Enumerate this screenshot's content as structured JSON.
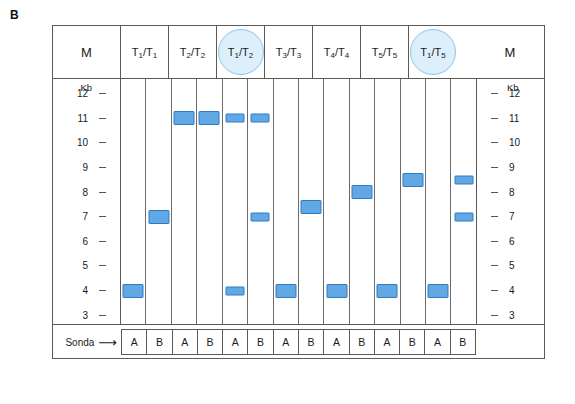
{
  "figure": {
    "panel_label": "B",
    "colors": {
      "band_fill": "#62a8e5",
      "band_border": "#2e7bc4",
      "highlight_fill": "#ddeffa",
      "highlight_border": "#8cc4e8",
      "frame_line": "#5a5a5a"
    }
  },
  "header": {
    "marker_left": "M",
    "marker_right": "M",
    "genotypes": [
      {
        "label": "T₁/T₁",
        "base": "T",
        "sub1": "1",
        "sub2": "1",
        "highlighted": false
      },
      {
        "label": "T₂/T₂",
        "base": "T",
        "sub1": "2",
        "sub2": "2",
        "highlighted": false
      },
      {
        "label": "T₁/T₂",
        "base": "T",
        "sub1": "1",
        "sub2": "2",
        "highlighted": true
      },
      {
        "label": "T₃/T₃",
        "base": "T",
        "sub1": "3",
        "sub2": "3",
        "highlighted": false
      },
      {
        "label": "T₄/T₄",
        "base": "T",
        "sub1": "4",
        "sub2": "4",
        "highlighted": false
      },
      {
        "label": "T₅/T₅",
        "base": "T",
        "sub1": "5",
        "sub2": "5",
        "highlighted": false
      },
      {
        "label": "T₁/T₅",
        "base": "T",
        "sub1": "1",
        "sub2": "5",
        "highlighted": true
      }
    ]
  },
  "ladder": {
    "caption": "Kb",
    "values": [
      12,
      11,
      10,
      9,
      8,
      7,
      6,
      5,
      4,
      3
    ]
  },
  "footer": {
    "sonda_label": "Sonda",
    "arrow": "➡",
    "probes": [
      "A",
      "B",
      "A",
      "B",
      "A",
      "B",
      "A",
      "B",
      "A",
      "B",
      "A",
      "B",
      "A",
      "B"
    ]
  },
  "chart_data": {
    "type": "table",
    "ylabel": "Kb",
    "ylim": [
      2.6,
      12.6
    ],
    "axis_ticks": [
      12,
      11,
      10,
      9,
      8,
      7,
      6,
      5,
      4,
      3
    ],
    "lane_count": 14,
    "lanes": [
      {
        "lane": 1,
        "genotype": "T₁/T₁",
        "probe": "A",
        "bands_kb": [
          4.0
        ]
      },
      {
        "lane": 2,
        "genotype": "T₁/T₁",
        "probe": "B",
        "bands_kb": [
          7.0
        ]
      },
      {
        "lane": 3,
        "genotype": "T₂/T₂",
        "probe": "A",
        "bands_kb": [
          11.0
        ]
      },
      {
        "lane": 4,
        "genotype": "T₂/T₂",
        "probe": "B",
        "bands_kb": [
          11.0
        ]
      },
      {
        "lane": 5,
        "genotype": "T₁/T₂",
        "probe": "A",
        "bands_kb": [
          11.0,
          4.0
        ]
      },
      {
        "lane": 6,
        "genotype": "T₁/T₂",
        "probe": "B",
        "bands_kb": [
          11.0,
          7.0
        ]
      },
      {
        "lane": 7,
        "genotype": "T₃/T₃",
        "probe": "A",
        "bands_kb": [
          4.0
        ]
      },
      {
        "lane": 8,
        "genotype": "T₃/T₃",
        "probe": "B",
        "bands_kb": [
          7.4
        ]
      },
      {
        "lane": 9,
        "genotype": "T₄/T₄",
        "probe": "A",
        "bands_kb": [
          4.0
        ]
      },
      {
        "lane": 10,
        "genotype": "T₄/T₄",
        "probe": "B",
        "bands_kb": [
          8.0
        ]
      },
      {
        "lane": 11,
        "genotype": "T₅/T₅",
        "probe": "A",
        "bands_kb": [
          4.0
        ]
      },
      {
        "lane": 12,
        "genotype": "T₅/T₅",
        "probe": "B",
        "bands_kb": [
          8.5
        ]
      },
      {
        "lane": 13,
        "genotype": "T₁/T₅",
        "probe": "A",
        "bands_kb": [
          4.0
        ]
      },
      {
        "lane": 14,
        "genotype": "T₁/T₅",
        "probe": "B",
        "bands_kb": [
          8.5,
          7.0
        ]
      }
    ],
    "band_sizes": {
      "1": [
        [
          4.0,
          "wide"
        ]
      ],
      "2": [
        [
          7.0,
          "wide"
        ]
      ],
      "3": [
        [
          11.0,
          "wide"
        ]
      ],
      "4": [
        [
          11.0,
          "wide"
        ]
      ],
      "5": [
        [
          11.0,
          "narrow"
        ],
        [
          4.0,
          "narrow"
        ]
      ],
      "6": [
        [
          11.0,
          "narrow"
        ],
        [
          7.0,
          "narrow"
        ]
      ],
      "7": [
        [
          4.0,
          "wide"
        ]
      ],
      "8": [
        [
          7.4,
          "wide"
        ]
      ],
      "9": [
        [
          4.0,
          "wide"
        ]
      ],
      "10": [
        [
          8.0,
          "wide"
        ]
      ],
      "11": [
        [
          4.0,
          "wide"
        ]
      ],
      "12": [
        [
          8.5,
          "wide"
        ]
      ],
      "13": [
        [
          4.0,
          "wide"
        ]
      ],
      "14": [
        [
          8.5,
          "narrow"
        ],
        [
          7.0,
          "narrow"
        ]
      ]
    }
  }
}
